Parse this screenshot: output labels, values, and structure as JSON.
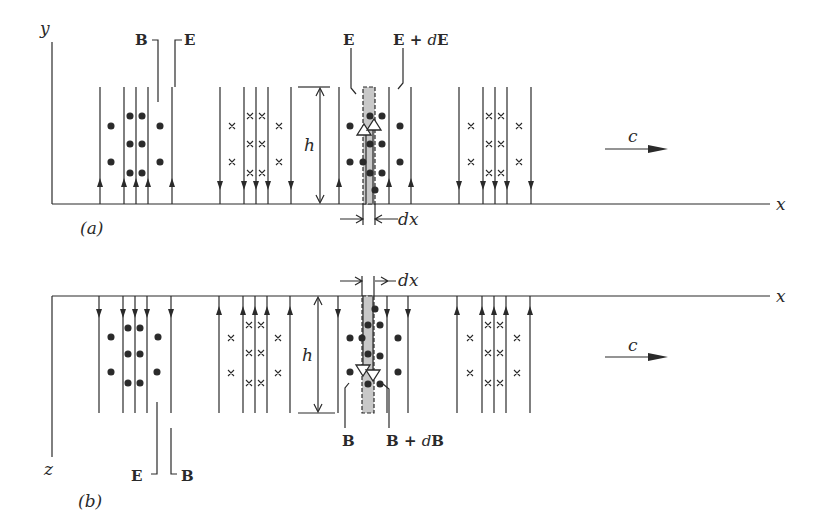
{
  "figure": {
    "panel_a": {
      "label": "(a)",
      "axis_vertical": "y",
      "axis_horizontal": "x",
      "field_labels": {
        "B": "B",
        "E": "E"
      },
      "slab_labels": {
        "left": "E",
        "right_prefix": "E + ",
        "right_d": "d",
        "right_sym": "E"
      },
      "height_label": "h",
      "width_label": "dx",
      "propagation_label": "c"
    },
    "panel_b": {
      "label": "(b)",
      "axis_vertical": "z",
      "axis_horizontal": "x",
      "field_labels": {
        "E": "E",
        "B": "B"
      },
      "slab_labels": {
        "left": "B",
        "right_prefix": "B + ",
        "right_d": "d",
        "right_sym": "B"
      },
      "height_label": "h",
      "width_label": "dx",
      "propagation_label": "c"
    },
    "colors": {
      "ink": "#2a2a2a",
      "slab": "#c8c8c8"
    }
  }
}
